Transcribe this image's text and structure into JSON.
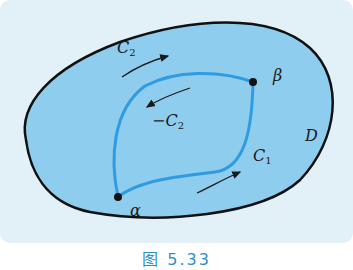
{
  "figure": {
    "caption": "图 5.33",
    "region_label": "D",
    "points": {
      "alpha": "α",
      "beta": "β"
    },
    "curves": {
      "c1": {
        "base": "C",
        "sub": "1"
      },
      "c2": {
        "base": "C",
        "sub": "2"
      },
      "neg_c2": {
        "prefix": "−",
        "base": "C",
        "sub": "2"
      }
    },
    "colors": {
      "background": "#e2f1f8",
      "region_fill": "#8fcdef",
      "region_border": "#111111",
      "path": "#2f9be0",
      "caption": "#2e8fc9"
    }
  }
}
